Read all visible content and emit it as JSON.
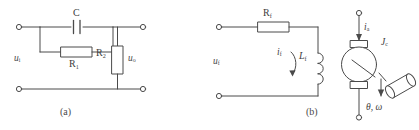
{
  "figure": {
    "type": "electrical-circuit-schematic",
    "line_color": "#4a4a4a",
    "text_color": "#3a3a3a",
    "background": "#ffffff",
    "width": 419,
    "height": 130
  },
  "circuit_a": {
    "caption": "(a)",
    "input_label": "u",
    "input_sub": "i",
    "output_label": "u",
    "output_sub": "o",
    "components": [
      {
        "name": "capacitor",
        "label": "C",
        "sub": ""
      },
      {
        "name": "resistor-series",
        "label": "R",
        "sub": "1"
      },
      {
        "name": "resistor-shunt",
        "label": "R",
        "sub": "2"
      }
    ],
    "cap_label": "C",
    "r1_label": "R",
    "r1_sub": "1",
    "r2_label": "R",
    "r2_sub": "2"
  },
  "circuit_b": {
    "caption": "(b)",
    "input_label": "u",
    "input_sub": "f",
    "resistor_label": "R",
    "resistor_sub": "f",
    "inductor_label": "L",
    "inductor_sub": "f",
    "current_label": "i",
    "current_sub": "f",
    "armature_current_label": "i",
    "armature_current_sub": "a",
    "inertia_label": "J",
    "inertia_sub": "c",
    "shaft_label": "θ, ω",
    "motor_name": "dc-motor"
  }
}
